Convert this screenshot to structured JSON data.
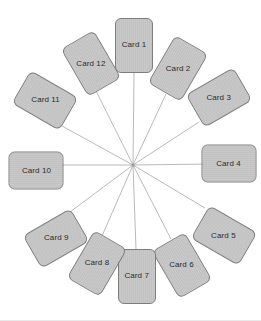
{
  "diagram": {
    "type": "radial-spoke",
    "background_color": "#ffffff",
    "card_fill_color": "#c5c5c5",
    "card_border_color": "#7d7d7d",
    "card_text_color": "#2b2b2b",
    "spoke_line_color": "#a8a8a8",
    "hub": {
      "x": 133,
      "y": 165,
      "dot_color": "#9a9a9a"
    },
    "card_size": {
      "width": 38,
      "height": 55
    },
    "card_count": 12,
    "cards": [
      {
        "label": "Card 1",
        "cx": 134,
        "cy": 45,
        "rotation": 0
      },
      {
        "label": "Card 2",
        "cx": 178,
        "cy": 68,
        "rotation": 30
      },
      {
        "label": "Card 3",
        "cx": 219,
        "cy": 97,
        "rotation": 60
      },
      {
        "label": "Card 4",
        "cx": 229,
        "cy": 163,
        "rotation": 90
      },
      {
        "label": "Card 5",
        "cx": 224,
        "cy": 235,
        "rotation": 120
      },
      {
        "label": "Card 6",
        "cx": 182,
        "cy": 265,
        "rotation": 150
      },
      {
        "label": "Card 7",
        "cx": 137,
        "cy": 276,
        "rotation": 180
      },
      {
        "label": "Card 8",
        "cx": 97,
        "cy": 263,
        "rotation": 210
      },
      {
        "label": "Card 9",
        "cx": 56,
        "cy": 238,
        "rotation": 240
      },
      {
        "label": "Card 10",
        "cx": 36,
        "cy": 170,
        "rotation": 270
      },
      {
        "label": "Card 11",
        "cx": 45,
        "cy": 100,
        "rotation": 300
      },
      {
        "label": "Card 12",
        "cx": 91,
        "cy": 63,
        "rotation": 330
      }
    ],
    "spokes": [
      {
        "from_label": "Card 1",
        "x1": 134,
        "y1": 73,
        "x2": 133,
        "y2": 165
      },
      {
        "from_label": "Card 2",
        "x1": 166,
        "y1": 94,
        "x2": 133,
        "y2": 165
      },
      {
        "from_label": "Card 3",
        "x1": 199,
        "y1": 122,
        "x2": 133,
        "y2": 165
      },
      {
        "from_label": "Card 4",
        "x1": 211,
        "y1": 164,
        "x2": 133,
        "y2": 165
      },
      {
        "from_label": "Card 5",
        "x1": 205,
        "y1": 208,
        "x2": 133,
        "y2": 165
      },
      {
        "from_label": "Card 6",
        "x1": 171,
        "y1": 239,
        "x2": 133,
        "y2": 165
      },
      {
        "from_label": "Card 7",
        "x1": 136,
        "y1": 249,
        "x2": 133,
        "y2": 165
      },
      {
        "from_label": "Card 8",
        "x1": 102,
        "y1": 236,
        "x2": 133,
        "y2": 165
      },
      {
        "from_label": "Card 9",
        "x1": 70,
        "y1": 212,
        "x2": 133,
        "y2": 165
      },
      {
        "from_label": "Card 10",
        "x1": 55,
        "y1": 165,
        "x2": 133,
        "y2": 165
      },
      {
        "from_label": "Card 11",
        "x1": 62,
        "y1": 126,
        "x2": 133,
        "y2": 165
      },
      {
        "from_label": "Card 12",
        "x1": 96,
        "y1": 91,
        "x2": 133,
        "y2": 165
      }
    ]
  }
}
